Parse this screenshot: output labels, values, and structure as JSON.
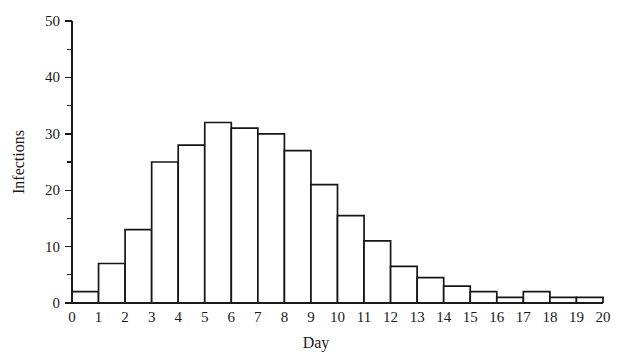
{
  "chart_data": {
    "type": "bar",
    "title": "",
    "subtitle": "",
    "xlabel": "Day",
    "ylabel": "Infections",
    "categories": [
      "1",
      "2",
      "3",
      "4",
      "5",
      "6",
      "7",
      "8",
      "9",
      "10",
      "11",
      "12",
      "13",
      "14",
      "15",
      "16",
      "17",
      "18",
      "19",
      "20"
    ],
    "values": [
      2,
      7,
      13,
      25,
      28,
      32,
      31,
      30,
      27,
      21,
      15.5,
      11,
      6.5,
      4.5,
      3,
      2,
      1,
      2,
      1,
      1
    ],
    "x_tick_labels": [
      "0",
      "1",
      "2",
      "3",
      "4",
      "5",
      "6",
      "7",
      "8",
      "9",
      "10",
      "11",
      "12",
      "13",
      "14",
      "15",
      "16",
      "17",
      "18",
      "19",
      "20"
    ],
    "y_tick_labels": [
      "0",
      "10",
      "20",
      "30",
      "40",
      "50"
    ],
    "y_major_ticks": [
      0,
      10,
      20,
      30,
      40,
      50
    ],
    "y_minor_ticks": [
      5,
      15,
      25,
      35,
      45
    ],
    "ylim": [
      0,
      50
    ],
    "xlim": [
      0,
      20
    ],
    "grid": false,
    "legend": null,
    "legend_position": "none",
    "annotations": [],
    "colors": {
      "bar_fill": "#ffffff",
      "bar_stroke": "#161616",
      "axis": "#1a1a1a",
      "background": "#ffffff",
      "text": "#1a1a1a"
    }
  }
}
